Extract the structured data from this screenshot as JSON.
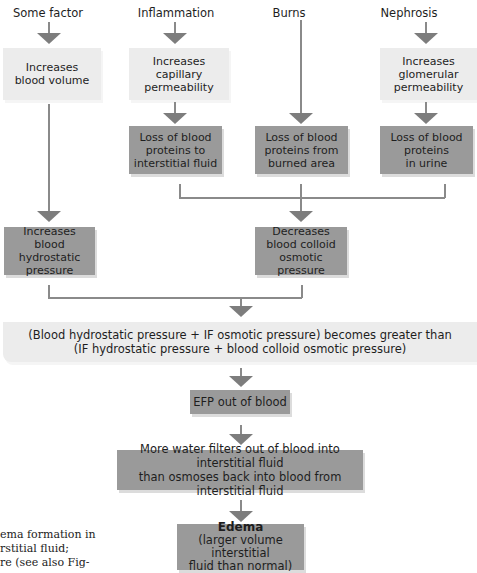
{
  "causes": {
    "some_factor": "Some factor",
    "inflammation": "Inflammation",
    "burns": "Burns",
    "nephrosis": "Nephrosis"
  },
  "boxes": {
    "increases_blood_volume": [
      "Increases",
      "blood volume"
    ],
    "increases_capillary_permeability": [
      "Increases",
      "capillary",
      "permeability"
    ],
    "increases_glomerular_permeability": [
      "Increases",
      "glomerular",
      "permeability"
    ],
    "loss_to_interstitial": [
      "Loss of blood",
      "proteins to",
      "interstitial fluid"
    ],
    "loss_from_burned": [
      "Loss of blood",
      "proteins from",
      "burned area"
    ],
    "loss_in_urine": [
      "Loss of blood",
      "proteins",
      "in urine"
    ],
    "increases_hydrostatic": [
      "Increases",
      "blood hydrostatic",
      "pressure"
    ],
    "decreases_colloid": [
      "Decreases",
      "blood colloid",
      "osmotic pressure"
    ],
    "pressure_comparison": [
      "(Blood hydrostatic pressure + IF osmotic pressure) becomes greater than",
      "(IF hydrostatic pressure + blood colloid osmotic pressure)"
    ],
    "efp": "EFP out of blood",
    "more_water": [
      "More water filters out of blood into interstitial fluid",
      "than osmoses back into blood from interstitial fluid"
    ],
    "edema_title": "Edema",
    "edema_sub": [
      "(larger volume interstitial",
      "fluid than normal)"
    ]
  },
  "caption": [
    "ema formation in",
    "rstitial fluid;",
    "re (see also Fig-"
  ],
  "colors": {
    "light_box": "#ececec",
    "dark_box": "#9a9a9a",
    "arrow": "#7d7d7d",
    "line": "#8a8a8a"
  }
}
